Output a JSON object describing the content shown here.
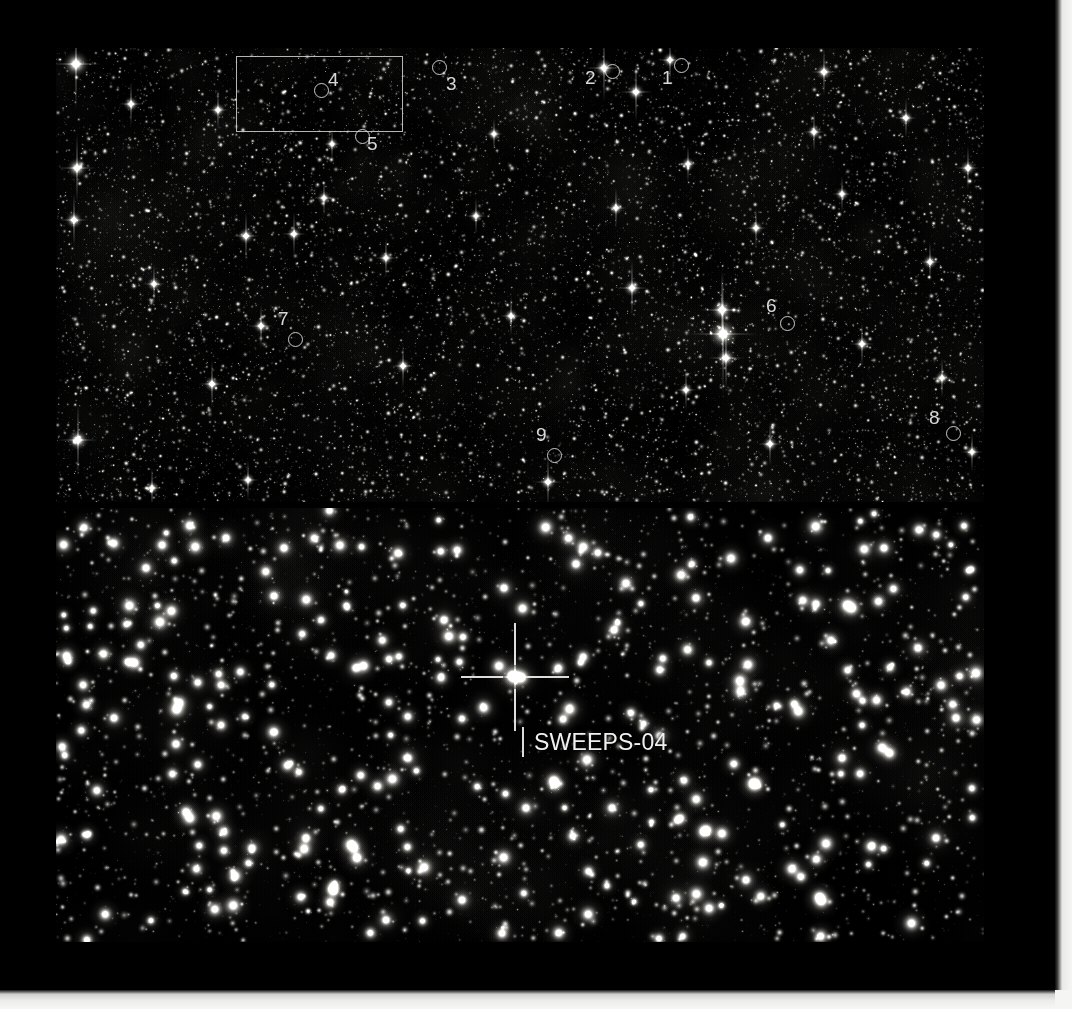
{
  "figure": {
    "background_color": "#000000",
    "border_color": "#f2f2f0",
    "panel_background": "#000000",
    "annotation_color": "#eeeeee"
  },
  "wide_panel": {
    "name": "wide-field-starfield",
    "roi_box": {
      "label": "region-of-interest-rectangle",
      "x": 180,
      "y": 8,
      "width": 167,
      "height": 76
    },
    "markers": [
      {
        "id": "1",
        "label": "1",
        "ring_x": 618,
        "ring_y": 10,
        "num_x": 606,
        "num_y": 20
      },
      {
        "id": "2",
        "label": "2",
        "ring_x": 549,
        "ring_y": 16,
        "num_x": 529,
        "num_y": 20
      },
      {
        "id": "3",
        "label": "3",
        "ring_x": 376,
        "ring_y": 12,
        "num_x": 390,
        "num_y": 26
      },
      {
        "id": "4",
        "label": "4",
        "ring_x": 258,
        "ring_y": 35,
        "num_x": 272,
        "num_y": 22
      },
      {
        "id": "5",
        "label": "5",
        "ring_x": 299,
        "ring_y": 81,
        "num_x": 311,
        "num_y": 86
      },
      {
        "id": "6",
        "label": "6",
        "ring_x": 724,
        "ring_y": 268,
        "num_x": 710,
        "num_y": 248
      },
      {
        "id": "7",
        "label": "7",
        "ring_x": 232,
        "ring_y": 284,
        "num_x": 222,
        "num_y": 261
      },
      {
        "id": "8",
        "label": "8",
        "ring_x": 890,
        "ring_y": 378,
        "num_x": 873,
        "num_y": 360
      },
      {
        "id": "9",
        "label": "9",
        "ring_x": 491,
        "ring_y": 400,
        "num_x": 480,
        "num_y": 377
      }
    ]
  },
  "zoom_panel": {
    "name": "zoomed-starfield",
    "target": {
      "label": "SWEEPS-04",
      "label_x": 478,
      "label_y": 223,
      "reticle_center_x": 459,
      "reticle_center_y": 169,
      "reticle_arm_length": 42,
      "reticle_gap": 12
    }
  }
}
